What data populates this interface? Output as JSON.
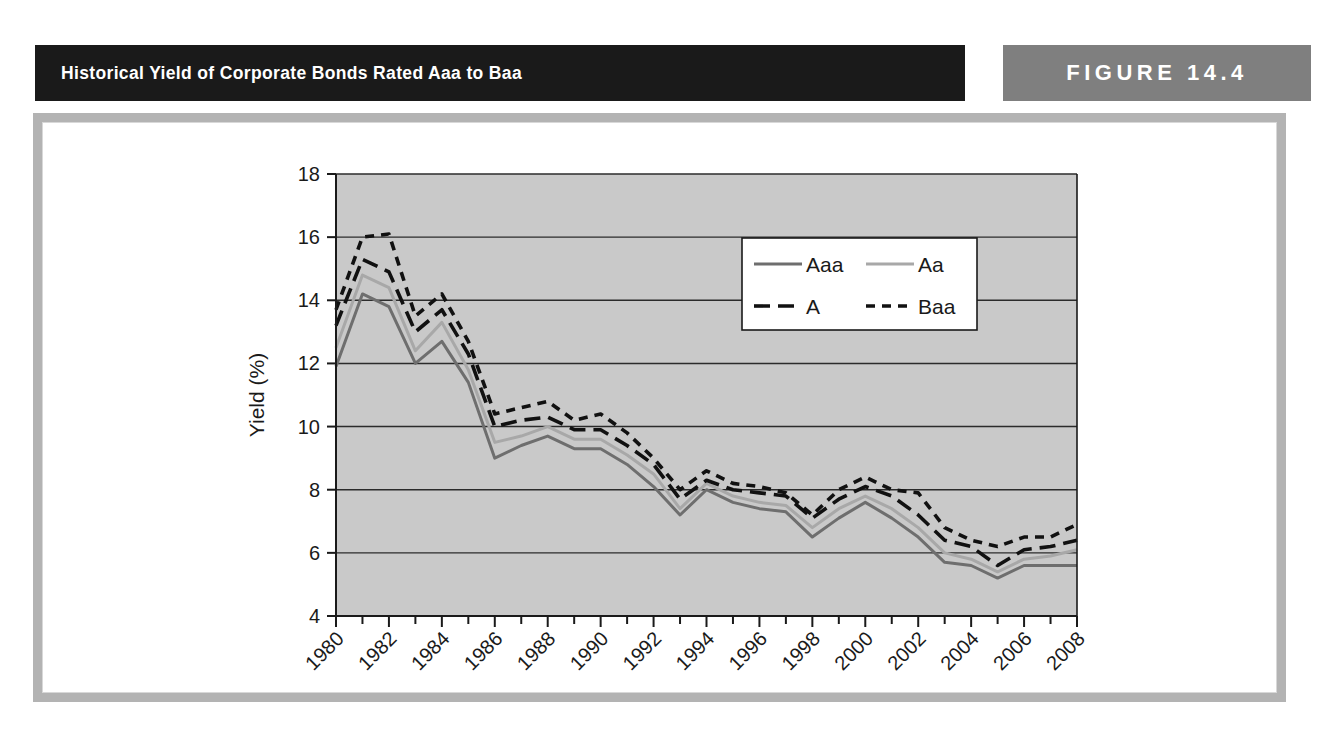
{
  "header": {
    "title": "Historical Yield of Corporate Bonds Rated Aaa to Baa",
    "figure_label": "FIGURE 14.4",
    "title_band_color": "#1a1a1a",
    "figure_band_color": "#7f7f7f",
    "frame_color": "#b3b3b3"
  },
  "chart_data": {
    "type": "line",
    "title": "Historical Yield of Corporate Bonds Rated Aaa to Baa",
    "xlabel": "Year",
    "ylabel": "Yield (%)",
    "xlim": [
      1980,
      2008
    ],
    "ylim": [
      4,
      18
    ],
    "ytick_values": [
      4,
      6,
      8,
      10,
      12,
      14,
      16,
      18
    ],
    "ytick_labels": [
      "4",
      "6",
      "8",
      "10",
      "12",
      "14",
      "16",
      "18"
    ],
    "xtick_values": [
      1980,
      1982,
      1984,
      1986,
      1988,
      1990,
      1992,
      1994,
      1996,
      1998,
      2000,
      2002,
      2004,
      2006,
      2008
    ],
    "xtick_labels": [
      "1980",
      "1982",
      "1984",
      "1986",
      "1988",
      "1990",
      "1992",
      "1994",
      "1996",
      "1998",
      "2000",
      "2002",
      "2004",
      "2006",
      "2008"
    ],
    "xtick_rotation_deg": -45,
    "minor_xticks_every": 1,
    "grid": "horizontal",
    "plot_background": "#c9c9c9",
    "legend_position": "upper-right-inside",
    "x": [
      1980,
      1981,
      1982,
      1983,
      1984,
      1985,
      1986,
      1987,
      1988,
      1989,
      1990,
      1991,
      1992,
      1993,
      1994,
      1995,
      1996,
      1997,
      1998,
      1999,
      2000,
      2001,
      2002,
      2003,
      2004,
      2005,
      2006,
      2007,
      2008
    ],
    "series": [
      {
        "name": "Aaa",
        "style": "solid",
        "color": "#6e6e6e",
        "values": [
          11.9,
          14.2,
          13.8,
          12.0,
          12.7,
          11.4,
          9.0,
          9.4,
          9.7,
          9.3,
          9.3,
          8.8,
          8.1,
          7.2,
          8.0,
          7.6,
          7.4,
          7.3,
          6.5,
          7.1,
          7.6,
          7.1,
          6.5,
          5.7,
          5.6,
          5.2,
          5.6,
          5.6,
          5.6
        ]
      },
      {
        "name": "Aa",
        "style": "solid",
        "color": "#a8a8a8",
        "values": [
          12.5,
          14.8,
          14.4,
          12.4,
          13.3,
          11.8,
          9.5,
          9.7,
          10.0,
          9.6,
          9.6,
          9.1,
          8.5,
          7.4,
          8.2,
          7.8,
          7.6,
          7.5,
          6.8,
          7.4,
          7.8,
          7.4,
          6.8,
          6.0,
          5.8,
          5.4,
          5.8,
          5.9,
          6.1
        ]
      },
      {
        "name": "A",
        "style": "dashed-long",
        "color": "#111111",
        "values": [
          13.2,
          15.3,
          14.9,
          13.0,
          13.7,
          12.3,
          10.0,
          10.2,
          10.3,
          9.9,
          9.9,
          9.4,
          8.8,
          7.7,
          8.3,
          8.0,
          7.9,
          7.8,
          7.1,
          7.7,
          8.1,
          7.8,
          7.2,
          6.4,
          6.2,
          5.6,
          6.1,
          6.2,
          6.4
        ]
      },
      {
        "name": "Baa",
        "style": "dashed-short",
        "color": "#111111",
        "values": [
          13.7,
          16.0,
          16.1,
          13.5,
          14.2,
          12.7,
          10.4,
          10.6,
          10.8,
          10.2,
          10.4,
          9.8,
          9.0,
          8.0,
          8.6,
          8.2,
          8.1,
          7.9,
          7.2,
          8.0,
          8.4,
          8.0,
          7.9,
          6.8,
          6.4,
          6.2,
          6.5,
          6.5,
          6.9
        ]
      }
    ],
    "legend": [
      {
        "name": "Aaa",
        "style": "solid",
        "color": "#6e6e6e"
      },
      {
        "name": "Aa",
        "style": "solid",
        "color": "#a8a8a8"
      },
      {
        "name": "A",
        "style": "dashed-long",
        "color": "#111111"
      },
      {
        "name": "Baa",
        "style": "dashed-short",
        "color": "#111111"
      }
    ]
  }
}
